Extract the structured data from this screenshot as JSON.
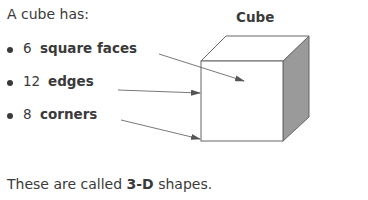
{
  "intro": "A cube has:",
  "figure_title": "Cube",
  "bullets": [
    {
      "number": "6",
      "label": "square faces"
    },
    {
      "number": "12",
      "label": "edges"
    },
    {
      "number": "8",
      "label": "corners"
    }
  ],
  "footer": {
    "prefix": "These are called ",
    "term": "3-D",
    "suffix": " shapes."
  },
  "colors": {
    "text": "#3a3a3a",
    "cube_side": "#9a9a9a",
    "line": "#555555"
  }
}
